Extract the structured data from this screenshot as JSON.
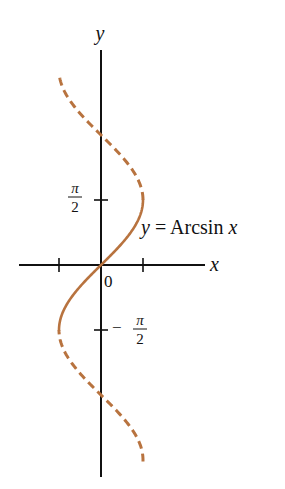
{
  "chart_data": {
    "type": "line",
    "title": "",
    "xlabel": "x",
    "ylabel": "y",
    "curve_label": "y = Arcsin x",
    "origin_label": "0",
    "y_tick_labels": [
      {
        "value": 1.5708,
        "num": "π",
        "den": "2",
        "sign": ""
      },
      {
        "value": -1.5708,
        "num": "π",
        "den": "2",
        "sign": "−"
      }
    ],
    "x_ticks": [
      -1,
      1
    ],
    "y_ticks": [
      -1.5708,
      1.5708
    ],
    "xlim": [
      -2,
      2.5
    ],
    "ylim": [
      -5.2,
      5.5
    ],
    "grid": false,
    "legend": "none",
    "series": [
      {
        "name": "y = Arcsin x (principal branch, solid)",
        "style": "solid",
        "relation": "x = sin(y)",
        "y_range": [
          -1.5708,
          1.5708
        ],
        "points": [
          [
            -1,
            -1.5708
          ],
          [
            -0.707,
            -0.7854
          ],
          [
            0,
            0
          ],
          [
            0.707,
            0.7854
          ],
          [
            1,
            1.5708
          ]
        ]
      },
      {
        "name": "x = sin y (upper extension, dashed)",
        "style": "dashed",
        "relation": "x = sin(y)",
        "y_range": [
          1.5708,
          4.55
        ],
        "points": [
          [
            1,
            1.5708
          ],
          [
            0.707,
            2.356
          ],
          [
            0,
            3.1416
          ],
          [
            -0.707,
            3.927
          ],
          [
            -0.986,
            4.55
          ]
        ]
      },
      {
        "name": "x = sin y (lower extension, dashed)",
        "style": "dashed",
        "relation": "x = sin(y)",
        "y_range": [
          -4.75,
          -1.5708
        ],
        "points": [
          [
            -1,
            -1.5708
          ],
          [
            -0.707,
            -2.356
          ],
          [
            0,
            -3.1416
          ],
          [
            0.707,
            -3.927
          ],
          [
            0.999,
            -4.75
          ]
        ]
      }
    ],
    "colors": {
      "curve": "#b8733f",
      "axes": "#111111"
    }
  }
}
